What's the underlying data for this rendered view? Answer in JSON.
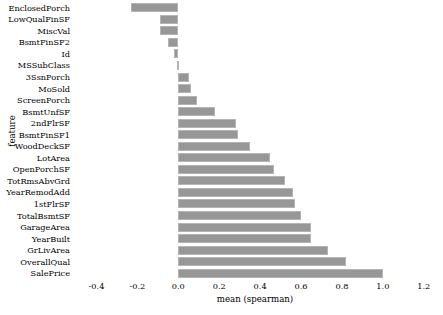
{
  "chart_data": {
    "type": "bar",
    "orientation": "horizontal",
    "title": "",
    "xlabel": "mean (spearman)",
    "ylabel": "feature",
    "xlim": [
      -0.5,
      1.25
    ],
    "xticks": [
      "-0.4",
      "-0.2",
      "0.0",
      "0.2",
      "0.4",
      "0.6",
      "0.8",
      "1.0",
      "1.2"
    ],
    "xtick_values": [
      -0.4,
      -0.2,
      0.0,
      0.2,
      0.4,
      0.6,
      0.8,
      1.0,
      1.2
    ],
    "grid": false,
    "legend": "none",
    "bar_color": "#979797",
    "bar_edge_color": "#b4b4b4",
    "background": "#ffffff",
    "categories": [
      "EnclosedPorch",
      "LowQualFinSF",
      "MiscVal",
      "BsmtFinSF2",
      "Id",
      "MSSubClass",
      "3SsnPorch",
      "MoSold",
      "ScreenPorch",
      "BsmtUnfSF",
      "2ndFlrSF",
      "BsmtFinSF1",
      "WoodDeckSF",
      "LotArea",
      "OpenPorchSF",
      "TotRmsAbvGrd",
      "YearRemodAdd",
      "1stFlrSF",
      "TotalBsmtSF",
      "GarageArea",
      "YearBuilt",
      "GrLivArea",
      "OverallQual",
      "SalePrice"
    ],
    "values": [
      -0.23,
      -0.09,
      -0.09,
      -0.05,
      -0.02,
      -0.005,
      0.05,
      0.06,
      0.09,
      0.18,
      0.28,
      0.29,
      0.35,
      0.45,
      0.47,
      0.52,
      0.56,
      0.57,
      0.6,
      0.65,
      0.65,
      0.73,
      0.82,
      1.0
    ]
  }
}
